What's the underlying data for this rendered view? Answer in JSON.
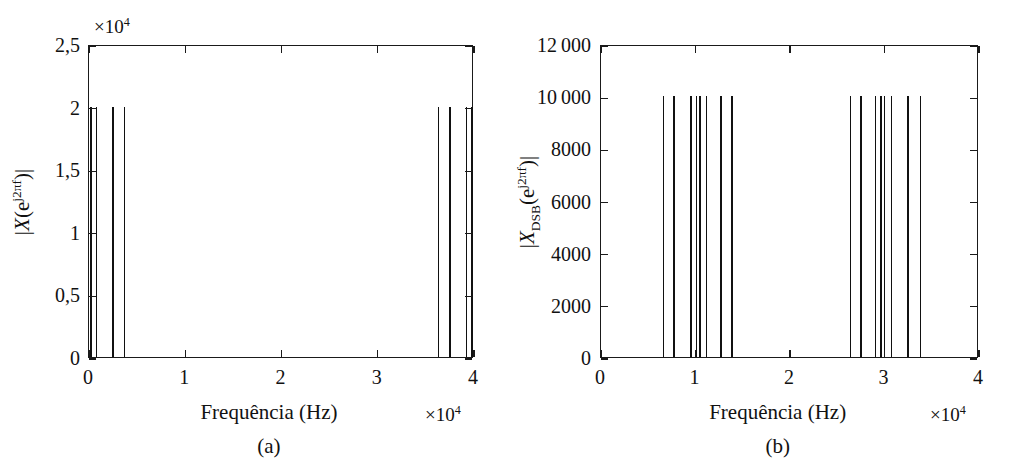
{
  "figure": {
    "background": "#ffffff",
    "ink_color": "#111111",
    "panels": [
      {
        "id": "a",
        "caption": "(a)",
        "xlabel": "Frequência (Hz)",
        "x_multiplier": "×10",
        "x_multiplier_exp": "4",
        "y_multiplier": "×10",
        "y_multiplier_exp": "4",
        "ylabel_parts": {
          "open": "|",
          "var": "X",
          "paren_open": "(e",
          "exp": "j2πf",
          "paren_close": ")",
          "close": "|"
        },
        "xticks": [
          "0",
          "1",
          "2",
          "3",
          "4"
        ],
        "yticks": [
          "0",
          "0,5",
          "1",
          "1,5",
          "2",
          "2,5"
        ]
      },
      {
        "id": "b",
        "caption": "(b)",
        "xlabel": "Frequência (Hz)",
        "x_multiplier": "×10",
        "x_multiplier_exp": "4",
        "y_multiplier": "",
        "y_multiplier_exp": "",
        "ylabel_parts": {
          "open": "|",
          "var": "X",
          "sub": "DSB",
          "paren_open": "(e",
          "exp": "j2πf",
          "paren_close": ")",
          "close": "|"
        },
        "xticks": [
          "0",
          "1",
          "2",
          "3",
          "4"
        ],
        "yticks": [
          "0",
          "2000",
          "4000",
          "6000",
          "8000",
          "10 000",
          "12 000"
        ]
      }
    ]
  },
  "chart_data": [
    {
      "type": "bar",
      "id": "a",
      "title": "",
      "subtitle": "(a)",
      "xlabel": "Frequência (Hz)",
      "ylabel": "|X(e^{j2πf})|",
      "x_scale_multiplier": 10000,
      "y_scale_multiplier": 10000,
      "xlim": [
        0,
        40000
      ],
      "ylim": [
        0,
        25000
      ],
      "xticks": [
        0,
        10000,
        20000,
        30000,
        40000
      ],
      "xticklabels": [
        "0",
        "1",
        "2",
        "3",
        "4"
      ],
      "yticks": [
        0,
        5000,
        10000,
        15000,
        20000,
        25000
      ],
      "yticklabels": [
        "0",
        "0,5",
        "1",
        "1,5",
        "2",
        "2,5"
      ],
      "grid": false,
      "legend": null,
      "x": [
        200,
        800,
        2500,
        3700,
        36300,
        37500,
        39200,
        39800
      ],
      "values": [
        20000,
        20000,
        20000,
        20000,
        20000,
        20000,
        20000,
        20000
      ],
      "note": "Espectro do sinal mensagem: raias em torno de 0 Hz e suas imagens proximas de 40 kHz"
    },
    {
      "type": "bar",
      "id": "b",
      "title": "",
      "subtitle": "(b)",
      "xlabel": "Frequência (Hz)",
      "ylabel": "|X_DSB(e^{j2πf})|",
      "x_scale_multiplier": 10000,
      "y_scale_multiplier": 1,
      "xlim": [
        0,
        40000
      ],
      "ylim": [
        0,
        12000
      ],
      "xticks": [
        0,
        10000,
        20000,
        30000,
        40000
      ],
      "xticklabels": [
        "0",
        "1",
        "2",
        "3",
        "4"
      ],
      "yticks": [
        0,
        2000,
        4000,
        6000,
        8000,
        10000,
        12000
      ],
      "yticklabels": [
        "0",
        "2000",
        "4000",
        "6000",
        "8000",
        "10 000",
        "12 000"
      ],
      "grid": false,
      "legend": null,
      "x": [
        6600,
        7700,
        9550,
        10100,
        10450,
        11150,
        12700,
        13850,
        26400,
        27500,
        29050,
        29650,
        30000,
        30750,
        32500,
        33800
      ],
      "values": [
        10000,
        10000,
        10000,
        10000,
        10000,
        10000,
        10000,
        10000,
        10000,
        10000,
        10000,
        10000,
        10000,
        10000,
        10000,
        10000
      ],
      "note": "Espectro do sinal modulado DSB: bandas laterais deslocadas para a portadora"
    }
  ]
}
